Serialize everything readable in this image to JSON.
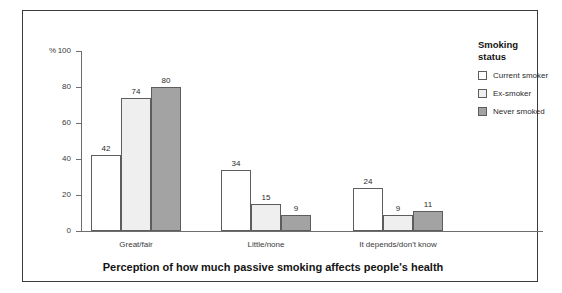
{
  "chart_data": {
    "type": "bar",
    "title": "",
    "xlabel": "Perception of how much passive smoking affects people's health",
    "ylabel": "%",
    "ylim": [
      0,
      100
    ],
    "yticks": [
      0,
      20,
      40,
      60,
      80,
      100
    ],
    "ytick_labels": [
      "0",
      "20",
      "40",
      "60",
      "80",
      "100"
    ],
    "grid": false,
    "legend_position": "right",
    "categories": [
      "Great/fair",
      "Little/none",
      "It depends/don't know"
    ],
    "series": [
      {
        "name": "Current smoker",
        "values": [
          42,
          34,
          24
        ],
        "color": "#ffffff"
      },
      {
        "name": "Ex-smoker",
        "values": [
          74,
          15,
          9
        ],
        "color": "#efefef"
      },
      {
        "name": "Never smoked",
        "values": [
          80,
          9,
          11
        ],
        "color": "#a3a3a3"
      }
    ]
  },
  "legend": {
    "title": "Smoking\nstatus"
  },
  "axis": {
    "percent_symbol": "%"
  }
}
